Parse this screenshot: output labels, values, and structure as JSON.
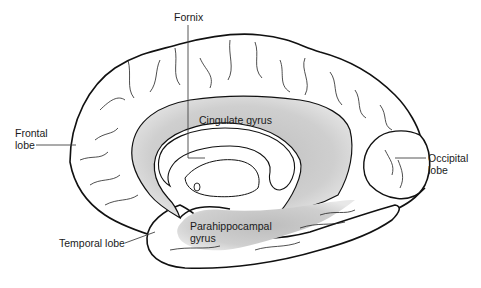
{
  "diagram": {
    "colors": {
      "outline": "#111111",
      "fill": "#ffffff",
      "limbic_shade": "#c9c9c9",
      "leader_line": "#444444",
      "text": "#1a1a1a"
    },
    "labels": {
      "fornix": {
        "lines": [
          "Fornix"
        ]
      },
      "cingulate_gyrus": {
        "lines": [
          "Cingulate gyrus"
        ]
      },
      "frontal_lobe": {
        "lines": [
          "Frontal",
          "lobe"
        ]
      },
      "occipital_lobe": {
        "lines": [
          "Occipital",
          "lobe"
        ]
      },
      "parahippocampal_gyrus": {
        "lines": [
          "Parahippocampal",
          "gyrus"
        ]
      },
      "temporal_lobe": {
        "lines": [
          "Temporal lobe"
        ]
      }
    }
  }
}
